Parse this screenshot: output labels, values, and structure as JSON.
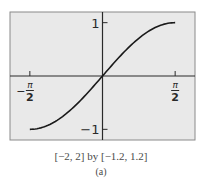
{
  "chart_data": {
    "type": "line",
    "title": "",
    "function": "y = sin(x)",
    "domain_shown": [
      -1.5708,
      1.5708
    ],
    "xlim": [
      -2,
      2
    ],
    "ylim": [
      -1.2,
      1.2
    ],
    "xlabel": "",
    "ylabel": "",
    "grid": false,
    "legend": null,
    "x_ticks": [
      {
        "value": -1.5708,
        "label_sign": "−",
        "label_num": "π",
        "label_den": "2"
      },
      {
        "value": 1.5708,
        "label_sign": "",
        "label_num": "π",
        "label_den": "2"
      }
    ],
    "y_ticks": [
      {
        "value": 1,
        "label": "1"
      },
      {
        "value": -1,
        "label": "−1"
      }
    ],
    "series": [
      {
        "name": "sin(x)",
        "x": [
          -1.5708,
          -1.3,
          -1.0,
          -0.75,
          -0.5,
          -0.25,
          0,
          0.25,
          0.5,
          0.75,
          1.0,
          1.3,
          1.5708
        ],
        "y": [
          -1.0,
          -0.964,
          -0.841,
          -0.682,
          -0.479,
          -0.247,
          0,
          0.247,
          0.479,
          0.682,
          0.841,
          0.964,
          1.0
        ]
      }
    ],
    "window_caption": "[−2, 2] by [−1.2, 1.2]",
    "sub_caption": "(a)"
  },
  "style": {
    "plot_background": "#e9e9e9",
    "frame_color": "#8a8a8a",
    "axis_color": "#2a2a2a",
    "curve_color": "#1a1a1a",
    "label_color": "#2a2a2a"
  },
  "layout": {
    "plot_box": {
      "left": 10,
      "top": 12,
      "right": 195,
      "bottom": 140
    }
  }
}
